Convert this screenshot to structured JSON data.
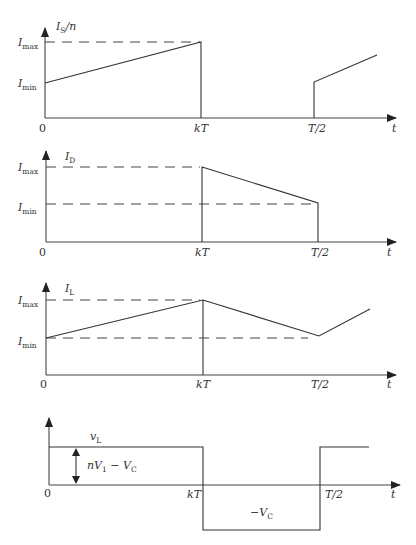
{
  "diagram": {
    "panels": [
      {
        "id": "switch-current",
        "ylabel": "I",
        "ylabel_sub": "S",
        "ylabel_suffix": "/n",
        "levels": {
          "max": "I",
          "max_sub": "max",
          "min": "I",
          "min_sub": "min"
        },
        "origin": "0",
        "ticks": [
          "kT",
          "T/2"
        ],
        "xlabel": "t"
      },
      {
        "id": "diode-current",
        "ylabel": "I",
        "ylabel_sub": "D",
        "levels": {
          "max": "I",
          "max_sub": "max",
          "min": "I",
          "min_sub": "min"
        },
        "origin": "0",
        "ticks": [
          "kT",
          "T/2"
        ],
        "xlabel": "t"
      },
      {
        "id": "inductor-current",
        "ylabel": "I",
        "ylabel_sub": "L",
        "levels": {
          "max": "I",
          "max_sub": "max",
          "min": "I",
          "min_sub": "min"
        },
        "origin": "0",
        "ticks": [
          "kT",
          "T/2"
        ],
        "xlabel": "t"
      },
      {
        "id": "inductor-voltage",
        "ylabel": "v",
        "ylabel_sub": "L",
        "amplitude_label": {
          "p1": "nV",
          "s1": "1",
          "p2": " − V",
          "s2": "C"
        },
        "negative_label": {
          "p": "−V",
          "s": "C"
        },
        "origin": "0",
        "ticks": [
          "kT",
          "T/2"
        ],
        "xlabel": "t"
      }
    ]
  }
}
